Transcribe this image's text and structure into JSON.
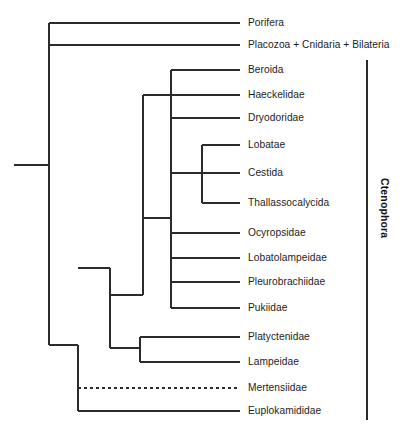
{
  "figure": {
    "type": "phylogenetic-tree",
    "orientation": "left-to-right-cladogram",
    "background_color": "#ffffff",
    "line_color": "#2b2b2b",
    "line_width": 1.1,
    "canvas": {
      "width": 413,
      "height": 436
    }
  },
  "chart_data": {
    "type": "tree",
    "title": "",
    "tips": [
      {
        "name": "Porifera",
        "y": 23,
        "branch_style": "solid",
        "x_start": 49,
        "x_end": 240
      },
      {
        "name": "Placozoa + Cnidaria + Bilateria",
        "y": 45,
        "branch_style": "solid",
        "x_start": 49,
        "x_end": 240
      },
      {
        "name": "Beroida",
        "y": 70,
        "branch_style": "solid",
        "x_start": 171,
        "x_end": 240
      },
      {
        "name": "Haeckelidae",
        "y": 95,
        "branch_style": "solid",
        "x_start": 143,
        "x_end": 240
      },
      {
        "name": "Dryodoridae",
        "y": 118,
        "branch_style": "solid",
        "x_start": 171,
        "x_end": 240
      },
      {
        "name": "Lobatae",
        "y": 145,
        "branch_style": "solid",
        "x_start": 202,
        "x_end": 240
      },
      {
        "name": "Cestida",
        "y": 173,
        "branch_style": "solid",
        "x_start": 171,
        "x_end": 240
      },
      {
        "name": "Thallassocalycida",
        "y": 203,
        "branch_style": "solid",
        "x_start": 202,
        "x_end": 240
      },
      {
        "name": "Ocyropsidae",
        "y": 233,
        "branch_style": "solid",
        "x_start": 171,
        "x_end": 240
      },
      {
        "name": "Lobatolampeidae",
        "y": 258,
        "branch_style": "solid",
        "x_start": 171,
        "x_end": 240
      },
      {
        "name": "Pleurobrachiidae",
        "y": 282,
        "branch_style": "solid",
        "x_start": 171,
        "x_end": 240
      },
      {
        "name": "Pukiidae",
        "y": 308,
        "branch_style": "solid",
        "x_start": 171,
        "x_end": 240
      },
      {
        "name": "Platyctenidae",
        "y": 337,
        "branch_style": "solid",
        "x_start": 140,
        "x_end": 240
      },
      {
        "name": "Lampeidae",
        "y": 362,
        "branch_style": "solid",
        "x_start": 140,
        "x_end": 240
      },
      {
        "name": "Mertensiidae",
        "y": 388,
        "branch_style": "dashed",
        "x_start": 78,
        "x_end": 240
      },
      {
        "name": "Euplokamididae",
        "y": 411,
        "branch_style": "solid",
        "x_start": 78,
        "x_end": 240
      }
    ],
    "nodes": [
      {
        "id": "root-stem",
        "x1": 14,
        "y1": 165,
        "x2": 49,
        "y2": 165
      },
      {
        "id": "root-vertical",
        "x1": 49,
        "y1": 23,
        "x2": 49,
        "y2": 345
      },
      {
        "id": "ctenophore-stem",
        "x1": 49,
        "y1": 345,
        "x2": 78,
        "y2": 345
      },
      {
        "id": "ctenophora-vertical",
        "x1": 78,
        "y1": 345,
        "x2": 78,
        "y2": 411
      },
      {
        "id": "tentaculata-stem",
        "x1": 78,
        "y1": 268,
        "x2": 110,
        "y2": 268
      },
      {
        "id": "clade-b-vertical",
        "x1": 110,
        "y1": 268,
        "x2": 110,
        "y2": 348
      },
      {
        "id": "clade-b-stem",
        "x1": 110,
        "y1": 295,
        "x2": 143,
        "y2": 295
      },
      {
        "id": "clade-c-vertical",
        "x1": 143,
        "y1": 95,
        "x2": 143,
        "y2": 295
      },
      {
        "id": "clade-c-stem",
        "x1": 143,
        "y1": 218,
        "x2": 171,
        "y2": 218
      },
      {
        "id": "clade-d-vertical",
        "x1": 171,
        "y1": 70,
        "x2": 171,
        "y2": 308
      },
      {
        "id": "clade-d-stem",
        "x1": 171,
        "y1": 173,
        "x2": 202,
        "y2": 173
      },
      {
        "id": "clade-e-vertical",
        "x1": 202,
        "y1": 145,
        "x2": 202,
        "y2": 203
      },
      {
        "id": "platyctenid-stem",
        "x1": 110,
        "y1": 348,
        "x2": 140,
        "y2": 348
      },
      {
        "id": "platyctenid-vertical",
        "x1": 140,
        "y1": 337,
        "x2": 140,
        "y2": 362
      }
    ],
    "brackets": [
      {
        "label": "Ctenophora",
        "x": 367,
        "y_top": 60,
        "y_bottom": 420,
        "label_x": 390,
        "label_y": 178,
        "bold": true
      }
    ],
    "axis_ranges": {
      "x": [
        14,
        413
      ],
      "y": [
        0,
        436
      ]
    },
    "grid": false,
    "legend": "none"
  }
}
